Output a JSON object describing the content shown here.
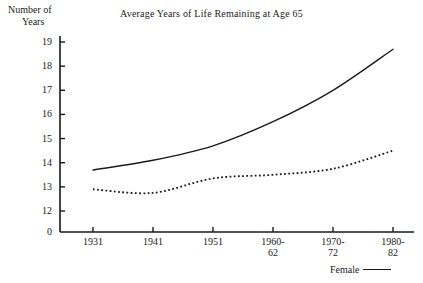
{
  "chart_data": {
    "type": "line",
    "title": "Average Years of Life Remaining at Age 65",
    "ylabel_line1": "Number of",
    "ylabel_line2": "Years",
    "xlabel": "",
    "categories": [
      "1931",
      "1941",
      "1951",
      "1960-62",
      "1970-72",
      "1980-82"
    ],
    "category_lines": [
      [
        "1931",
        ""
      ],
      [
        "1941",
        ""
      ],
      [
        "1951",
        ""
      ],
      [
        "1960-",
        "62"
      ],
      [
        "1970-",
        "72"
      ],
      [
        "1980-",
        "82"
      ]
    ],
    "yticks": [
      "19",
      "18",
      "17",
      "16",
      "15",
      "14",
      "13",
      "12",
      "0"
    ],
    "ytick_values": [
      19,
      18,
      17,
      16,
      15,
      14,
      13,
      12,
      0
    ],
    "ylim": [
      12,
      19
    ],
    "y_axis_broken": true,
    "grid": false,
    "legend_position": "bottom-right",
    "series": [
      {
        "name": "Female",
        "style": "solid",
        "color": "#1a1a1a",
        "values": [
          13.7,
          14.1,
          14.7,
          15.7,
          17.0,
          18.7
        ]
      },
      {
        "name": "Male",
        "style": "dotted",
        "color": "#1a1a1a",
        "values": [
          12.9,
          12.75,
          13.35,
          13.5,
          13.75,
          14.5
        ]
      }
    ],
    "legend_entries": [
      {
        "label": "Female",
        "style": "solid"
      }
    ]
  }
}
